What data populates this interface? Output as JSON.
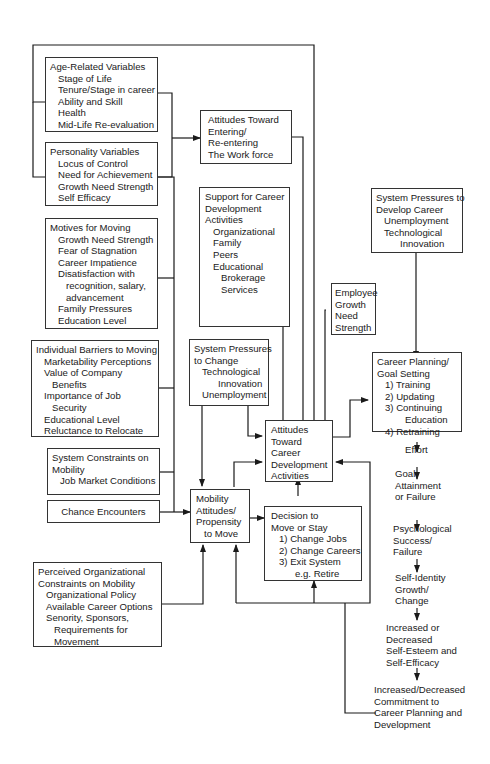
{
  "diagram": {
    "type": "career development flow model",
    "boxes": {
      "age_related": {
        "title": "Age-Related Variables",
        "items": [
          "Stage of Life",
          "Tenure/Stage in career",
          "Ability and Skill",
          "Health",
          "Mid-Life Re-evaluation"
        ]
      },
      "personality": {
        "title": "Personality Variables",
        "items": [
          "Locus of Control",
          "Need for Achievement",
          "Growth Need Strength",
          "Self Efficacy"
        ]
      },
      "motives": {
        "title": "Motives for Moving",
        "items": [
          "Growth Need Strength",
          "Fear of Stagnation",
          "Career Impatience",
          "Disatisfaction with",
          "recognition, salary,",
          "advancement",
          "Family Pressures",
          "Education Level"
        ]
      },
      "barriers": {
        "title": "Individual Barriers to Moving",
        "items": [
          "Marketability Perceptions",
          "Value of Company",
          "Benefits",
          "Importance of Job",
          "Security",
          "Educational Level",
          "Reluctance to Relocate"
        ]
      },
      "system_constraints": {
        "title": "System Constraints on",
        "title2": "Mobility",
        "items": [
          "Job Market Conditions"
        ]
      },
      "chance": {
        "title": "Chance Encounters"
      },
      "perceived_org": {
        "title": "Perceived Organizational",
        "title2": "Constraints on Mobility",
        "items": [
          "Organizational Policy",
          "Available Career Options",
          "Senority, Sponsors,",
          "Requirements for",
          "Movement"
        ]
      },
      "attitudes_workforce": {
        "lines": [
          "Attitudes Toward",
          "Entering/",
          "Re-entering",
          "The Work force"
        ]
      },
      "support": {
        "title": [
          "Support for Career",
          "Development",
          "Activities"
        ],
        "items": [
          "Organizational",
          "Family",
          "Peers",
          "Educational",
          "Brokerage",
          "Services"
        ]
      },
      "system_pressures_change": {
        "title": [
          "System Pressures",
          "to Change"
        ],
        "items": [
          "Technological",
          "Innovation",
          "Unemployment"
        ]
      },
      "employee_growth": {
        "lines": [
          "Employee",
          "Growth",
          "Need",
          "Strength"
        ]
      },
      "system_pressures_develop": {
        "title": [
          "System Pressures to",
          "Develop Career"
        ],
        "items": [
          "Unemployment",
          "Technological",
          "Innovation"
        ]
      },
      "attitudes_career_dev": {
        "lines": [
          "Attitudes",
          "Toward",
          "Career",
          "Development",
          "Activities"
        ]
      },
      "mobility": {
        "lines": [
          "Mobility",
          "Attitudes/",
          "Propensity",
          "to Move"
        ]
      },
      "decision": {
        "title": [
          "Decision to",
          "Move or Stay"
        ],
        "items": [
          "1)  Change Jobs",
          "2)  Change Careers",
          "3)  Exit System",
          "e.g. Retire"
        ]
      },
      "career_planning": {
        "title": [
          "Career Planning/",
          "Goal Setting"
        ],
        "items": [
          "1)  Training",
          "2)  Updating",
          "3)  Continuing",
          "Education",
          "4)  Retraining"
        ]
      }
    },
    "outcome_chain": [
      [
        "Effort"
      ],
      [
        "Goal",
        "Attainment",
        "or Failure"
      ],
      [
        "Psychological",
        "Success/",
        "Failure"
      ],
      [
        "Self-Identity",
        "Growth/",
        "Change"
      ],
      [
        "Increased or",
        "Decreased",
        "Self-Esteem and",
        "Self-Efficacy"
      ],
      [
        "Increased/Decreased",
        "Commitment to",
        "Career Planning and",
        "Development"
      ]
    ],
    "colors": {
      "ink": "#1a1a1a",
      "background": "#ffffff"
    }
  }
}
